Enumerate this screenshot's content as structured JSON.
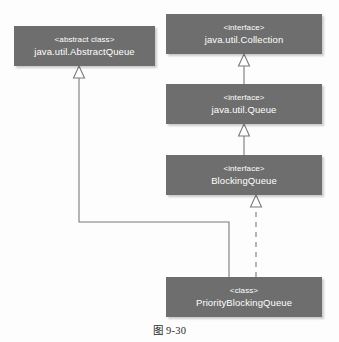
{
  "diagram": {
    "type": "uml-class-diagram",
    "caption": "图 9-30",
    "colors": {
      "box_fill": "#6e6e6e",
      "box_text": "#ffffff",
      "connector": "#7a7a7a",
      "page_background": "#fdfdfd",
      "caption_text": "#2b2b2b"
    },
    "nodes": [
      {
        "id": "abstractqueue",
        "stereotype": "<abstract class>",
        "name": "java.util.AbstractQueue"
      },
      {
        "id": "collection",
        "stereotype": "<interface>",
        "name": "java.util.Collection"
      },
      {
        "id": "queue",
        "stereotype": "<interface>",
        "name": "java.util.Queue"
      },
      {
        "id": "blockingqueue",
        "stereotype": "<interface>",
        "name": "BlockingQueue"
      },
      {
        "id": "priorityblockingqueue",
        "stereotype": "<class>",
        "name": "PriorityBlockingQueue"
      }
    ],
    "edges": [
      {
        "id": "queue-to-collection",
        "from": "queue",
        "to": "collection",
        "relation": "generalization",
        "line": "solid",
        "arrowhead": "hollow-triangle"
      },
      {
        "id": "blockingqueue-to-queue",
        "from": "blockingqueue",
        "to": "queue",
        "relation": "generalization",
        "line": "solid",
        "arrowhead": "hollow-triangle"
      },
      {
        "id": "priorityblockingqueue-to-blockingqueue",
        "from": "priorityblockingqueue",
        "to": "blockingqueue",
        "relation": "realization",
        "line": "dashed",
        "arrowhead": "hollow-triangle"
      },
      {
        "id": "priorityblockingqueue-to-abstractqueue",
        "from": "priorityblockingqueue",
        "to": "abstractqueue",
        "relation": "generalization",
        "line": "solid-elbow",
        "arrowhead": "hollow-triangle"
      }
    ]
  }
}
